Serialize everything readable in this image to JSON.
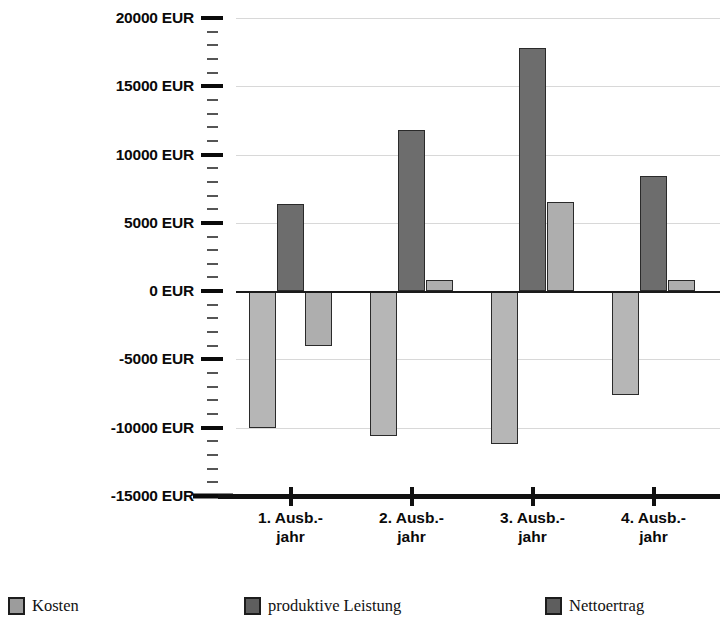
{
  "chart_data": {
    "type": "bar",
    "title": "",
    "subtitle": "",
    "xlabel": "",
    "ylabel": "",
    "unit": "EUR",
    "categories": [
      "1. Ausb.-jahr",
      "2. Ausb.-jahr",
      "3. Ausb.-jahr",
      "4. Ausb.-jahr"
    ],
    "category_lines": [
      [
        "1. Ausb.-",
        "jahr"
      ],
      [
        "2. Ausb.-",
        "jahr"
      ],
      [
        "3. Ausb.-",
        "jahr"
      ],
      [
        "4. Ausb.-",
        "jahr"
      ]
    ],
    "series": [
      {
        "name": "Kosten",
        "color": "#b6b6b6",
        "values": [
          -10000,
          -10600,
          -11200,
          -7600
        ]
      },
      {
        "name": "produktive Leistung",
        "color": "#6d6d6d",
        "values": [
          6400,
          11800,
          17800,
          8400
        ]
      },
      {
        "name": "Nettoertrag",
        "color": "#aeaeae",
        "values": [
          -4000,
          800,
          6500,
          850
        ]
      }
    ],
    "ylim": [
      -15000,
      20000
    ],
    "ytick_values": [
      20000,
      15000,
      10000,
      5000,
      0,
      -5000,
      -10000,
      -15000
    ],
    "ytick_labels": [
      "20000 EUR",
      "15000 EUR",
      "10000 EUR",
      "5000 EUR",
      "0 EUR",
      "-5000 EUR",
      "-10000 EUR",
      "-15000 EUR"
    ],
    "yminor_step": 1000,
    "grid": true,
    "legend_position": "bottom"
  },
  "legend": {
    "items": [
      {
        "label": "Kosten",
        "swatch_class": "s-kosten"
      },
      {
        "label": "produktive Leistung",
        "swatch_class": "s-leistung"
      },
      {
        "label": "Nettoertrag",
        "swatch_class": "s-netto"
      }
    ]
  }
}
